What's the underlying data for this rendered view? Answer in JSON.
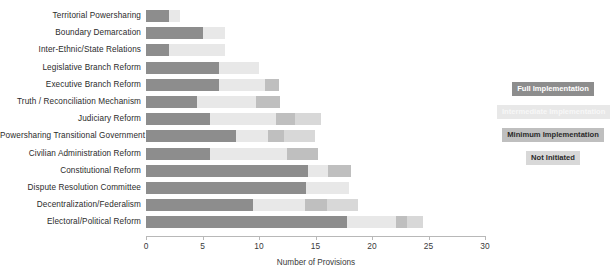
{
  "chart_data": {
    "type": "bar",
    "orientation": "horizontal",
    "stacked": true,
    "title": "",
    "xlabel": "Number of Provisions",
    "ylabel": "",
    "xlim": [
      0,
      30
    ],
    "xticks": [
      0,
      5,
      10,
      15,
      20,
      25,
      30
    ],
    "grid": false,
    "legend_position": "right",
    "categories": [
      "Territorial Powersharing",
      "Boundary Demarcation",
      "Inter-Ethnic/State Relations",
      "Legislative Branch Reform",
      "Executive Branch Reform",
      "Truth / Reconciliation Mechanism",
      "Judiciary Reform",
      "Powersharing Transitional Government",
      "Civilian Administration Reform",
      "Constitutional Reform",
      "Dispute Resolution Committee",
      "Decentralization/Federalism",
      "Electoral/Political Reform"
    ],
    "series": [
      {
        "name": "Full Implementation",
        "color": "#8d8d8d",
        "values": [
          2,
          5,
          2,
          6.5,
          6.5,
          4.5,
          5.7,
          8,
          5.7,
          14.3,
          14.2,
          9.5,
          17.8
        ]
      },
      {
        "name": "Intermediate Implementation",
        "color": "#e8e8e8",
        "values": [
          1,
          2,
          5,
          3.5,
          4,
          5.2,
          5.8,
          2.8,
          6.8,
          1.8,
          3.8,
          4.6,
          4.3
        ]
      },
      {
        "name": "Minimum Implementation",
        "color": "#bfbfbf",
        "values": [
          0,
          0,
          0,
          0,
          1.3,
          2.2,
          1.7,
          1.4,
          2.7,
          2.0,
          0,
          1.9,
          1.0
        ]
      },
      {
        "name": "Not Initiated",
        "color": "#d8d8d8",
        "values": [
          0,
          0,
          0,
          0,
          0,
          0,
          2.3,
          2.8,
          0,
          0,
          0,
          2.8,
          1.4
        ]
      }
    ],
    "totals": [
      3,
      7,
      7,
      10,
      11.8,
      11.9,
      15.5,
      15,
      15.2,
      18.1,
      18,
      18.8,
      24.5
    ]
  },
  "legend": {
    "items": [
      {
        "label": "Full Implementation",
        "color": "#8d8d8d",
        "text_color": "#ffffff"
      },
      {
        "label": "Intermediate Implementation",
        "color": "#e8e8e8",
        "text_color": "#f7f7f7"
      },
      {
        "label": "Minimum Implementation",
        "color": "#bfbfbf",
        "text_color": "#2b2b2b"
      },
      {
        "label": "Not Initiated",
        "color": "#d8d8d8",
        "text_color": "#2b2b2b"
      }
    ]
  },
  "axis": {
    "x_title": "Number of Provisions",
    "x_tick_labels": [
      "0",
      "5",
      "10",
      "15",
      "20",
      "25",
      "30"
    ]
  }
}
